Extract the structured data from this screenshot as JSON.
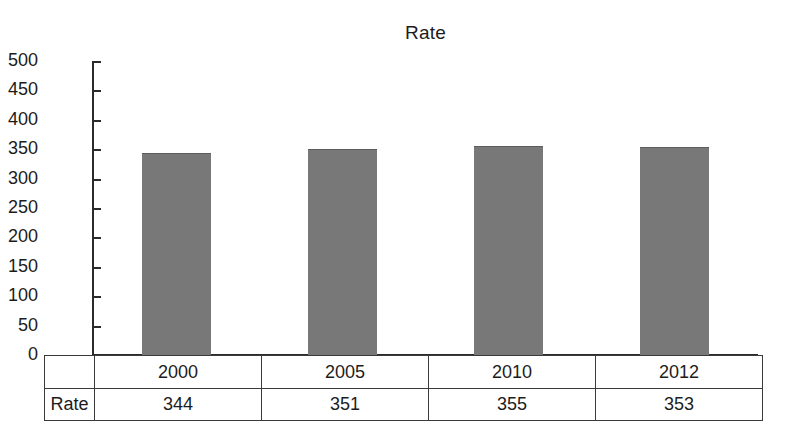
{
  "chart_data": {
    "type": "bar",
    "title": "Rate",
    "xlabel": "",
    "ylabel": "",
    "categories": [
      "2000",
      "2005",
      "2010",
      "2012"
    ],
    "series": [
      {
        "name": "Rate",
        "values": [
          344,
          351,
          355,
          353
        ]
      }
    ],
    "values": [
      344,
      351,
      355,
      353
    ],
    "ylim": [
      0,
      500
    ],
    "ytick_labels": [
      "500",
      "450",
      "400",
      "350",
      "300",
      "250",
      "200",
      "150",
      "100",
      "50",
      "0"
    ],
    "ytick_values": [
      500,
      450,
      400,
      350,
      300,
      250,
      200,
      150,
      100,
      50,
      0
    ],
    "ytick_step": 50,
    "grid": false,
    "legend": "none",
    "bar_color": "#787878",
    "axis_color": "#2b2b2b",
    "text_color": "#1c1c1c",
    "background": "#ffffff"
  },
  "table": {
    "row_header_label": "Rate",
    "header_cells": [
      "2000",
      "2005",
      "2010",
      "2012"
    ],
    "value_cells": [
      "344",
      "351",
      "355",
      "353"
    ]
  }
}
